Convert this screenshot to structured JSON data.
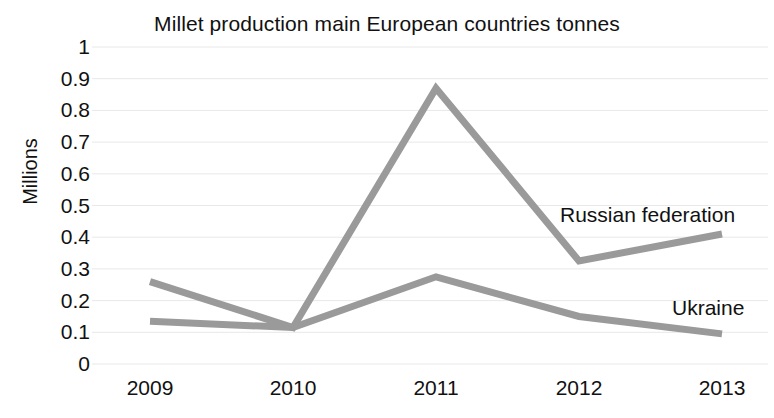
{
  "chart_data": {
    "type": "line",
    "title": "Millet production main European countries tonnes",
    "xlabel": "",
    "ylabel": "Millions",
    "categories": [
      "2009",
      "2010",
      "2011",
      "2012",
      "2013"
    ],
    "x": [
      2009,
      2010,
      2011,
      2012,
      2013
    ],
    "ylim": [
      0,
      1
    ],
    "yticks": [
      "0",
      "0.1",
      "0.2",
      "0.3",
      "0.4",
      "0.5",
      "0.6",
      "0.7",
      "0.8",
      "0.9",
      "1"
    ],
    "ytick_values": [
      0,
      0.1,
      0.2,
      0.3,
      0.4,
      0.5,
      0.6,
      0.7,
      0.8,
      0.9,
      1
    ],
    "grid": true,
    "grid_axis": "y",
    "legend": "inline-end-labels",
    "series": [
      {
        "name": "Russian federation",
        "values": [
          0.26,
          0.115,
          0.87,
          0.325,
          0.41
        ],
        "color": "#9a9a9a"
      },
      {
        "name": "Ukraine",
        "values": [
          0.135,
          0.115,
          0.275,
          0.15,
          0.095
        ],
        "color": "#9a9a9a"
      }
    ],
    "annotations": [
      {
        "text": "Russian federation",
        "series": "Russian federation"
      },
      {
        "text": "Ukraine",
        "series": "Ukraine"
      }
    ]
  },
  "colors": {
    "line": "#9a9a9a",
    "grid": "#e8e8e8",
    "text": "#111111",
    "background": "#ffffff"
  }
}
